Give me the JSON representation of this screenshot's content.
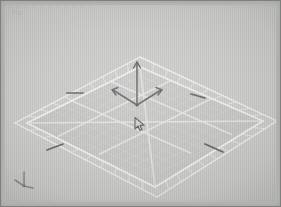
{
  "window": {
    "title": "3D Viewport",
    "viewport_label": "Top"
  },
  "viewport": {
    "background_color": "#c9cac7",
    "frame_color": "#b9bab8",
    "grid_line_color": "#d8d9d6",
    "grid_major_color": "#e6e7e4",
    "grid_border_color": "#eceded",
    "plane_fill_color": "#c3c4c1"
  },
  "grid": {
    "name": "construction-plane-grid",
    "inner_divisions": 4,
    "border_cells_per_side": 10,
    "orientation": "perspective-diamond"
  },
  "gizmo": {
    "name": "transform-move-gizmo",
    "type": "move",
    "color": "#56585a",
    "axes": [
      {
        "name": "z-axis-arrow",
        "direction": "up"
      },
      {
        "name": "x-axis-arrow",
        "direction": "left"
      },
      {
        "name": "y-axis-arrow",
        "direction": "right"
      }
    ]
  },
  "axis_tripod": {
    "name": "world-axis-indicator",
    "color": "#7e807e",
    "labels": []
  },
  "cursor": {
    "name": "mouse-cursor",
    "type": "arrow",
    "color": "#4e5052",
    "x": 128,
    "y": 111
  },
  "markers": [
    {
      "name": "grid-tick-top-left",
      "x": 73,
      "y": 72
    },
    {
      "name": "grid-tick-top-right",
      "x": 193,
      "y": 73
    },
    {
      "name": "grid-tick-bottom-left",
      "x": 55,
      "y": 137
    },
    {
      "name": "grid-tick-bottom-right",
      "x": 213,
      "y": 133
    }
  ]
}
